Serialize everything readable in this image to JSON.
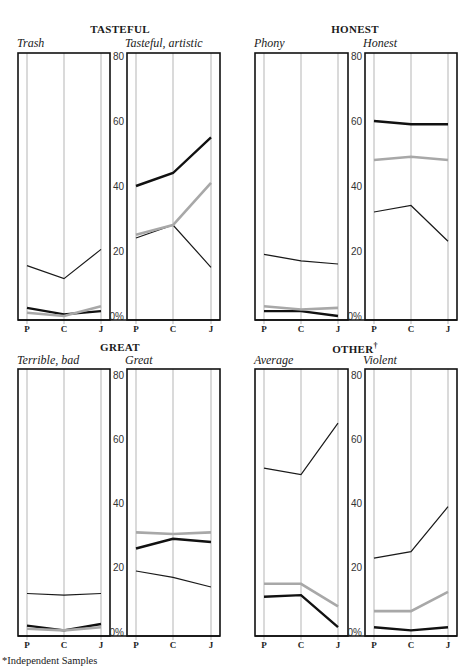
{
  "footnote": "*Independent Samples",
  "groups": [
    {
      "title": "TASTEFUL",
      "dagger": ""
    },
    {
      "title": "HONEST",
      "dagger": ""
    },
    {
      "title": "GREAT",
      "dagger": ""
    },
    {
      "title": "OTHER",
      "dagger": "†"
    }
  ],
  "panel_titles": [
    "Trash",
    "Tasteful, artistic",
    "Phony",
    "Honest",
    "Terrible, bad",
    "Great",
    "Average",
    "Violent"
  ],
  "y_ticks": [
    "80",
    "60",
    "40",
    "20",
    "0%"
  ],
  "x_ticks": [
    "P",
    "C",
    "J"
  ],
  "colors": {
    "thick": "#111111",
    "gray": "#a8a8a8",
    "thin": "#1a1a1a",
    "grid": "#b5b5b5",
    "frame": "#111111"
  },
  "chart_data": [
    {
      "type": "line",
      "group": "TASTEFUL",
      "title": "Trash",
      "categories": [
        "P",
        "C",
        "J"
      ],
      "ylim": [
        0,
        80
      ],
      "series": [
        {
          "name": "thin",
          "values": [
            15.5,
            11.5,
            20.5
          ]
        },
        {
          "name": "thick",
          "values": [
            2.5,
            0.5,
            1.5
          ]
        },
        {
          "name": "gray",
          "values": [
            1,
            0,
            3
          ]
        }
      ]
    },
    {
      "type": "line",
      "group": "TASTEFUL",
      "title": "Tasteful, artistic",
      "categories": [
        "P",
        "C",
        "J"
      ],
      "ylim": [
        0,
        80
      ],
      "series": [
        {
          "name": "thin",
          "values": [
            24,
            28,
            15
          ]
        },
        {
          "name": "thick",
          "values": [
            40,
            44,
            55
          ]
        },
        {
          "name": "gray",
          "values": [
            25,
            28,
            41
          ]
        }
      ]
    },
    {
      "type": "line",
      "group": "HONEST",
      "title": "Phony",
      "categories": [
        "P",
        "C",
        "J"
      ],
      "ylim": [
        0,
        80
      ],
      "series": [
        {
          "name": "thin",
          "values": [
            19,
            17,
            16
          ]
        },
        {
          "name": "thick",
          "values": [
            1.5,
            1.5,
            0
          ]
        },
        {
          "name": "gray",
          "values": [
            3,
            2,
            2.5
          ]
        }
      ]
    },
    {
      "type": "line",
      "group": "HONEST",
      "title": "Honest",
      "categories": [
        "P",
        "C",
        "J"
      ],
      "ylim": [
        0,
        80
      ],
      "series": [
        {
          "name": "thin",
          "values": [
            32,
            34,
            23
          ]
        },
        {
          "name": "thick",
          "values": [
            60,
            59,
            59
          ]
        },
        {
          "name": "gray",
          "values": [
            48,
            49,
            48
          ]
        }
      ]
    },
    {
      "type": "line",
      "group": "GREAT",
      "title": "Terrible, bad",
      "categories": [
        "P",
        "C",
        "J"
      ],
      "ylim": [
        0,
        80
      ],
      "series": [
        {
          "name": "thin",
          "values": [
            12,
            11.5,
            12
          ]
        },
        {
          "name": "thick",
          "values": [
            2,
            0.5,
            2.5
          ]
        },
        {
          "name": "gray",
          "values": [
            1,
            0.5,
            1.5
          ]
        }
      ]
    },
    {
      "type": "line",
      "group": "GREAT",
      "title": "Great",
      "categories": [
        "P",
        "C",
        "J"
      ],
      "ylim": [
        0,
        80
      ],
      "series": [
        {
          "name": "thin",
          "values": [
            19,
            17,
            14
          ]
        },
        {
          "name": "thick",
          "values": [
            26,
            29,
            28
          ]
        },
        {
          "name": "gray",
          "values": [
            31,
            30.5,
            31
          ]
        }
      ]
    },
    {
      "type": "line",
      "group": "OTHER",
      "title": "Average",
      "categories": [
        "P",
        "C",
        "J"
      ],
      "ylim": [
        0,
        80
      ],
      "series": [
        {
          "name": "thin",
          "values": [
            51,
            49,
            65
          ]
        },
        {
          "name": "thick",
          "values": [
            11,
            11.5,
            1.5
          ]
        },
        {
          "name": "gray",
          "values": [
            15,
            15,
            8
          ]
        }
      ]
    },
    {
      "type": "line",
      "group": "OTHER",
      "title": "Violent",
      "categories": [
        "P",
        "C",
        "J"
      ],
      "ylim": [
        0,
        80
      ],
      "series": [
        {
          "name": "thin",
          "values": [
            23,
            25,
            39
          ]
        },
        {
          "name": "thick",
          "values": [
            1.5,
            0.5,
            1.5
          ]
        },
        {
          "name": "gray",
          "values": [
            6.5,
            6.5,
            12.5
          ]
        }
      ]
    }
  ]
}
